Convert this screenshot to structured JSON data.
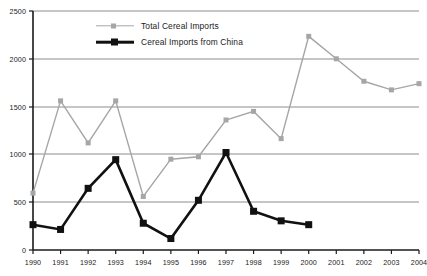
{
  "chart_data": {
    "type": "line",
    "title": "",
    "xlabel": "",
    "ylabel": "",
    "grid": true,
    "legend_position": "top-left",
    "categories": [
      "1990",
      "1991",
      "1992",
      "1993",
      "1994",
      "1995",
      "1996",
      "1997",
      "1998",
      "1999",
      "2000",
      "2001",
      "2002",
      "2003",
      "2004"
    ],
    "xlim": [
      1990,
      2004
    ],
    "ylim": [
      0,
      2500
    ],
    "yticks": [
      0,
      500,
      1000,
      1500,
      2000,
      2500
    ],
    "series": [
      {
        "name": "Total Cereal Imports",
        "color": "#a6a6a6",
        "marker": "square",
        "values": [
          595,
          1560,
          1120,
          1560,
          560,
          950,
          975,
          1360,
          1450,
          1165,
          2235,
          2000,
          1765,
          1675,
          1740
        ]
      },
      {
        "name": "Cereal Imports from China",
        "color": "#111111",
        "marker": "square",
        "values": [
          265,
          215,
          645,
          945,
          280,
          120,
          520,
          1020,
          405,
          305,
          265,
          null,
          null,
          null,
          null
        ]
      }
    ]
  },
  "axis": {
    "y_tick_labels": [
      "2500",
      "2000",
      "1500",
      "1000",
      "500",
      "0"
    ],
    "x_tick_labels": [
      "1990",
      "1991",
      "1992",
      "1993",
      "1994",
      "1995",
      "1996",
      "1997",
      "1998",
      "1999",
      "2000",
      "2001",
      "2002",
      "2003",
      "2004"
    ]
  },
  "legend": {
    "entries": [
      {
        "label": "Total Cereal Imports",
        "icon": "gray-line-square-marker"
      },
      {
        "label": "Cereal Imports from China",
        "icon": "black-line-square-marker"
      }
    ]
  },
  "colors": {
    "total_series": "#a6a6a6",
    "china_series": "#111111",
    "gridline": "#8c8c8c",
    "axis": "#1a1a1a",
    "background": "#ffffff"
  }
}
